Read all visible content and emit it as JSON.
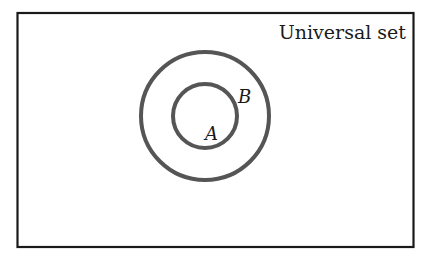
{
  "diagram": {
    "type": "venn-subset",
    "universal_label": "Universal set",
    "sets": [
      {
        "name": "B",
        "label": "B",
        "contains": [
          "A"
        ]
      },
      {
        "name": "A",
        "label": "A",
        "subset_of": "B"
      }
    ],
    "colors": {
      "frame": "#1a1a1a",
      "circle": "#555555",
      "background": "#ffffff"
    }
  }
}
